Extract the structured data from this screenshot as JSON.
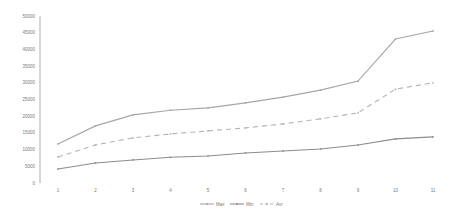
{
  "chart_data": {
    "type": "line",
    "title": "",
    "xlabel": "",
    "ylabel": "",
    "categories": [
      "1",
      "2",
      "3",
      "4",
      "5",
      "6",
      "7",
      "8",
      "9",
      "10",
      "11"
    ],
    "series": [
      {
        "name": "Max",
        "style": "solid",
        "color": "#a6a6a6",
        "values": [
          11700,
          17100,
          20400,
          21800,
          22500,
          24000,
          25700,
          27800,
          30500,
          43100,
          45500
        ]
      },
      {
        "name": "Min",
        "style": "solid",
        "color": "#8c8c8c",
        "values": [
          4200,
          6000,
          6900,
          7700,
          8100,
          9000,
          9600,
          10200,
          11400,
          13200,
          13800
        ]
      },
      {
        "name": "Avr",
        "style": "dashed",
        "color": "#b3b3b3",
        "values": [
          7800,
          11400,
          13500,
          14700,
          15600,
          16500,
          17700,
          19200,
          21000,
          28100,
          30000
        ]
      }
    ],
    "yticks": [
      "0",
      "5000",
      "10000",
      "15000",
      "20000",
      "25000",
      "30000",
      "35000",
      "40000",
      "45000",
      "50000"
    ],
    "ylim": [
      0,
      50000
    ],
    "grid": false,
    "legend_position": "bottom"
  }
}
